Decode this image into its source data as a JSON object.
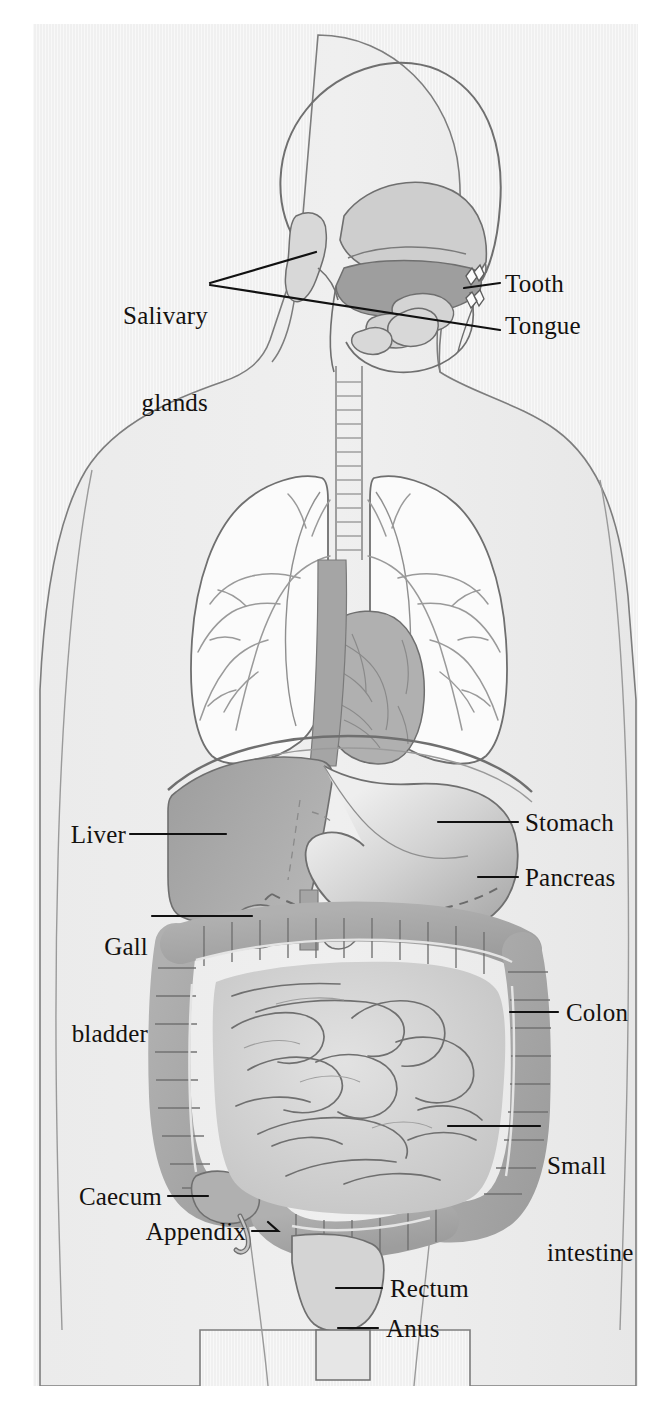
{
  "figure": {
    "view": "anterior torso cutaway with sagittal head section",
    "background_color": "#f0f0f0",
    "page_color": "#ffffff",
    "outline_color": "#6f6f6f",
    "label_color": "#14110f",
    "leader_color": "#111111"
  },
  "palette": {
    "body_fill": "#eceaea",
    "lung_fill": "#fbfbfb",
    "liver_fill": "#a8a8a8",
    "stomach_fill": "#b4b4b4",
    "stomach_highlight": "#eeeeee",
    "colon_fill": "#a9a9a9",
    "small_intestine_fill": "#cfcfcf",
    "oral_cavity_fill": "#9e9e9e",
    "gland_fill": "#d8d8d8",
    "heart_fill": "#b0b0b0",
    "esophagus_fill": "#a5a5a5",
    "rectum_fill": "#d4d4d4"
  },
  "labels": [
    {
      "id": "salivary-glands",
      "text_lines": [
        "Salivary",
        "glands"
      ],
      "text": "Salivary glands",
      "side": "left"
    },
    {
      "id": "tooth",
      "text_lines": [
        "Tooth"
      ],
      "text": "Tooth",
      "side": "right"
    },
    {
      "id": "tongue",
      "text_lines": [
        "Tongue"
      ],
      "text": "Tongue",
      "side": "right"
    },
    {
      "id": "liver",
      "text_lines": [
        "Liver"
      ],
      "text": "Liver",
      "side": "left"
    },
    {
      "id": "gall-bladder",
      "text_lines": [
        "Gall",
        "bladder"
      ],
      "text": "Gall bladder",
      "side": "left"
    },
    {
      "id": "stomach",
      "text_lines": [
        "Stomach"
      ],
      "text": "Stomach",
      "side": "right"
    },
    {
      "id": "pancreas",
      "text_lines": [
        "Pancreas"
      ],
      "text": "Pancreas",
      "side": "right"
    },
    {
      "id": "colon",
      "text_lines": [
        "Colon"
      ],
      "text": "Colon",
      "side": "right"
    },
    {
      "id": "small-intestine",
      "text_lines": [
        "Small",
        "intestine"
      ],
      "text": "Small intestine",
      "side": "right"
    },
    {
      "id": "caecum",
      "text_lines": [
        "Caecum"
      ],
      "text": "Caecum",
      "side": "left"
    },
    {
      "id": "appendix",
      "text_lines": [
        "Appendix"
      ],
      "text": "Appendix",
      "side": "left"
    },
    {
      "id": "rectum",
      "text_lines": [
        "Rectum"
      ],
      "text": "Rectum",
      "side": "right"
    },
    {
      "id": "anus",
      "text_lines": [
        "Anus"
      ],
      "text": "Anus",
      "side": "right"
    }
  ],
  "label_text": {
    "salivary_l1": "Salivary",
    "salivary_l2": "glands",
    "tooth": "Tooth",
    "tongue": "Tongue",
    "liver": "Liver",
    "gall_l1": "Gall",
    "gall_l2": "bladder",
    "stomach": "Stomach",
    "pancreas": "Pancreas",
    "colon": "Colon",
    "small_l1": "Small",
    "small_l2": "intestine",
    "caecum": "Caecum",
    "appendix": "Appendix",
    "rectum": "Rectum",
    "anus": "Anus"
  },
  "organs": [
    "skull",
    "oral cavity",
    "tongue",
    "teeth",
    "salivary glands",
    "trachea",
    "esophagus",
    "lungs",
    "heart",
    "diaphragm",
    "liver",
    "gall bladder",
    "stomach",
    "pancreas",
    "colon",
    "small intestine",
    "caecum",
    "appendix",
    "rectum",
    "anus"
  ]
}
